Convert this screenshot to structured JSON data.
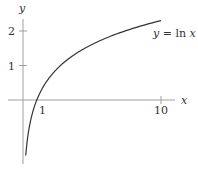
{
  "chart_data": {
    "type": "line",
    "title": "",
    "function": "y = ln x",
    "xlabel": "x",
    "ylabel": "y",
    "x_ticks": [
      1,
      10
    ],
    "x_tick_labels": [
      "1",
      "10"
    ],
    "y_ticks": [
      1,
      2
    ],
    "y_tick_labels": [
      "1",
      "2"
    ],
    "xlim": [
      -0.5,
      11
    ],
    "ylim": [
      -1.8,
      2.4
    ],
    "grid": false,
    "legend": null,
    "annotations": [
      {
        "text": "y = ln x",
        "x": 10,
        "y": 2.1
      }
    ],
    "series": [
      {
        "name": "y = ln x",
        "x": [
          0.2,
          0.3,
          0.5,
          0.75,
          1,
          1.5,
          2,
          3,
          4,
          5,
          6,
          7,
          8,
          9,
          10
        ],
        "y": [
          -1.609,
          -1.204,
          -0.693,
          -0.288,
          0,
          0.405,
          0.693,
          1.099,
          1.386,
          1.609,
          1.792,
          1.946,
          2.079,
          2.197,
          2.303
        ]
      }
    ],
    "colors": {
      "curve": "#333333",
      "axis": "#999999"
    }
  },
  "labels": {
    "x_axis": "x",
    "y_axis": "y",
    "tick_x1": "1",
    "tick_x10": "10",
    "tick_y1": "1",
    "tick_y2": "2",
    "curve_label_lhs": "y",
    "curve_label_eq": " = ",
    "curve_label_fn": "ln ",
    "curve_label_var": "x"
  }
}
